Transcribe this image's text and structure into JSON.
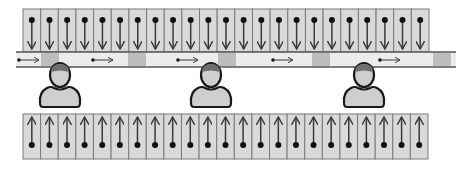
{
  "diagram": {
    "title": "",
    "colors": {
      "cell_fill": "#d9d9d9",
      "cell_border": "#7a7a7a",
      "arrow": "#3a3a3a",
      "dot": "#111111",
      "belt_fill": "#ececec",
      "belt_line": "#555555",
      "belt_block": "#bdbdbd",
      "person_body": "#cfcfcf",
      "person_outline": "#1a1a1a",
      "person_hair": "#6e6e6e"
    },
    "top_grid": {
      "columns": 23,
      "x": 23,
      "y": 9,
      "width": 406,
      "height": 43,
      "arrow_direction": "down",
      "icon": "down-arrow-icon"
    },
    "bottom_grid": {
      "columns": 23,
      "x": 23,
      "y": 114,
      "width": 405,
      "height": 45,
      "arrow_direction": "up",
      "icon": "up-arrow-icon"
    },
    "conveyor_belt": {
      "x": 16,
      "y": 52,
      "width": 440,
      "height": 15,
      "blocks_x": [
        41,
        128,
        218,
        312,
        433
      ],
      "block_width": 18,
      "arrows_x": [
        19,
        93,
        178,
        273,
        380
      ],
      "arrow_length": 20,
      "arrow_direction": "right"
    },
    "workers": [
      {
        "name": "worker-1",
        "cx": 60
      },
      {
        "name": "worker-2",
        "cx": 211
      },
      {
        "name": "worker-3",
        "cx": 364
      }
    ]
  }
}
